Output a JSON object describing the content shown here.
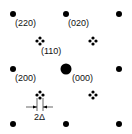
{
  "diagram": {
    "type": "electron diffraction pattern",
    "labels": {
      "l220": "(220)",
      "l020": "(020)",
      "l110": "(110)",
      "l200": "(200)",
      "l000": "(000)",
      "splitting": "2Δ"
    },
    "colors": {
      "spot": "#000000",
      "background": "#ffffff"
    }
  }
}
